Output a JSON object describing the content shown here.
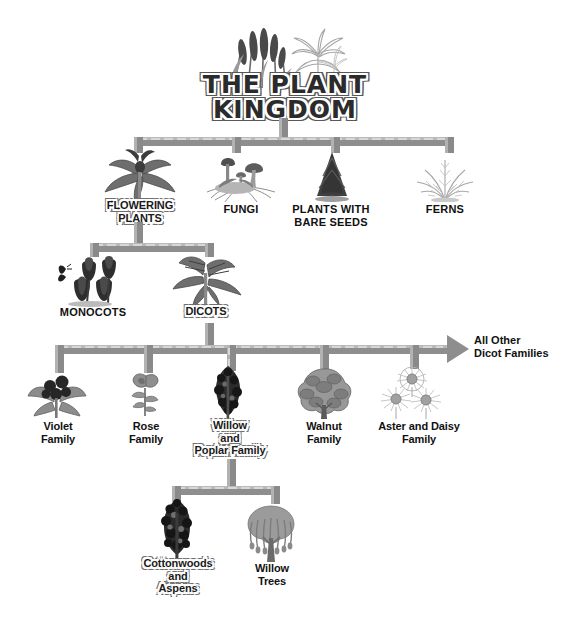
{
  "diagram": {
    "title_line1": "THE PLANT",
    "title_line2": "KINGDOM",
    "title_art": "cattails-and-palm-illustration"
  },
  "level1": {
    "nodes": [
      {
        "label": "FLOWERING\nPLANTS",
        "art": "violet-flower-illustration",
        "highlighted": true
      },
      {
        "label": "FUNGI",
        "art": "mushroom-cluster-illustration",
        "highlighted": false
      },
      {
        "label": "PLANTS WITH\nBARE SEEDS",
        "art": "conifer-tree-illustration",
        "highlighted": false
      },
      {
        "label": "FERNS",
        "art": "fern-fronds-illustration",
        "highlighted": false
      }
    ]
  },
  "level2": {
    "nodes": [
      {
        "label": "MONOCOTS",
        "art": "tulips-illustration",
        "highlighted": false
      },
      {
        "label": "DICOTS",
        "art": "broad-leaf-plant-illustration",
        "highlighted": true
      }
    ]
  },
  "level3": {
    "nodes": [
      {
        "label": "Violet\nFamily",
        "art": "violet-plant-illustration",
        "highlighted": false
      },
      {
        "label": "Rose\nFamily",
        "art": "rose-stem-illustration",
        "highlighted": false
      },
      {
        "label": "Willow\nand\nPoplar Family",
        "art": "poplar-tree-illustration",
        "highlighted": true
      },
      {
        "label": "Walnut\nFamily",
        "art": "walnut-tree-illustration",
        "highlighted": false
      },
      {
        "label": "Aster and Daisy\nFamily",
        "art": "daisies-illustration",
        "highlighted": false
      }
    ],
    "arrow_label": "All Other\nDicot Families",
    "arrow_icon": "arrow-right-icon"
  },
  "level4": {
    "nodes": [
      {
        "label": "Cottonwoods\nand\nAspens",
        "art": "cottonwood-tree-illustration",
        "highlighted": true
      },
      {
        "label": "Willow\nTrees",
        "art": "weeping-willow-illustration",
        "highlighted": false
      }
    ]
  },
  "colors": {
    "pipe": "#8e8e8e",
    "pipe_highlight": "#d8d8d8",
    "text": "#111111",
    "background": "#ffffff"
  }
}
